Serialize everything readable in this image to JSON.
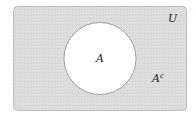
{
  "diagram": {
    "type": "venn",
    "universe_label": "U",
    "set_label": "A",
    "complement_label": "A",
    "complement_superscript": "c",
    "colors": {
      "universe_fill": "#dcdcdc",
      "universe_stroke": "#bdbdbd",
      "set_fill": "#ffffff",
      "set_stroke": "#8a8a8a"
    }
  }
}
